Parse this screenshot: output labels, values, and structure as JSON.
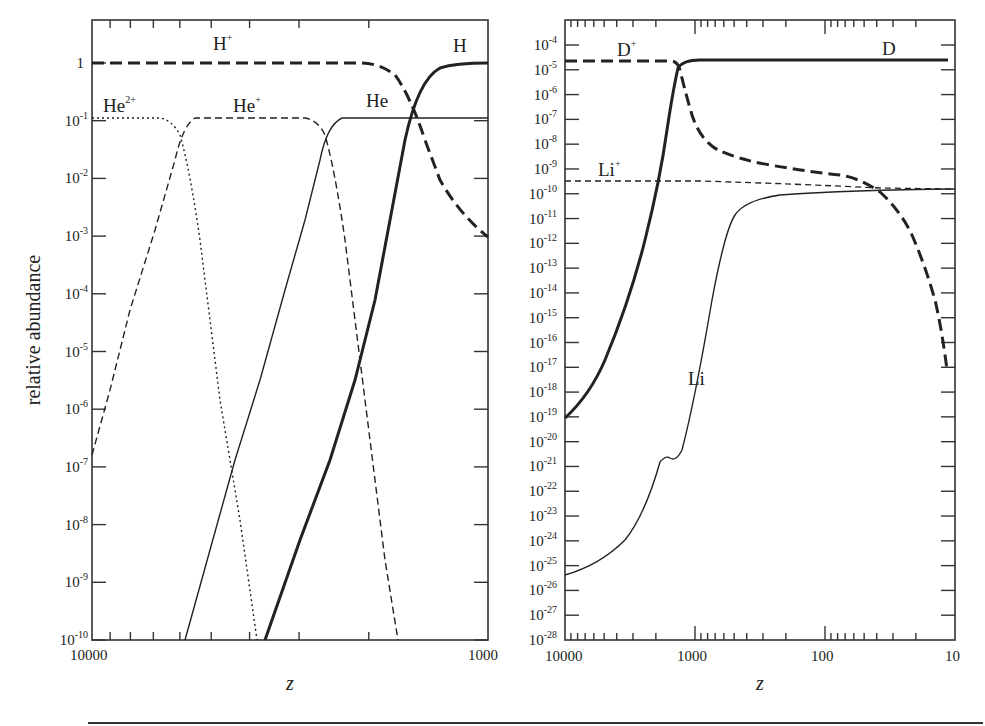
{
  "figure": {
    "ylabel": "relative abundance",
    "xlabel": "z"
  },
  "chart_data": [
    {
      "type": "line",
      "panel": "left",
      "title": "",
      "xlabel": "z",
      "ylabel": "relative abundance",
      "xscale": "log",
      "yscale": "log",
      "xlim": [
        10000,
        1000
      ],
      "ylim": [
        1e-10,
        5
      ],
      "x_tick_labels": [
        "10000",
        "1000"
      ],
      "y_tick_labels": [
        "1",
        "10^-1",
        "10^-2",
        "10^-3",
        "10^-4",
        "10^-5",
        "10^-6",
        "10^-7",
        "10^-8",
        "10^-9",
        "10^-10"
      ],
      "grid": false,
      "legend": "inline labels",
      "series": [
        {
          "name": "H+",
          "style": "thick dashed",
          "x": [
            10000,
            3000,
            1900,
            1700,
            1500,
            1300,
            1150,
            1000
          ],
          "y": [
            0.92,
            0.92,
            0.88,
            0.6,
            0.12,
            0.01,
            0.002,
            0.0009
          ]
        },
        {
          "name": "H",
          "style": "thick solid",
          "x": [
            4400,
            3500,
            2800,
            2300,
            2000,
            1800,
            1650,
            1400,
            1000
          ],
          "y": [
            1e-10,
            1e-08,
            1e-06,
            3e-05,
            0.003,
            0.1,
            0.6,
            0.9,
            0.92
          ]
        },
        {
          "name": "He2+",
          "style": "dotted",
          "x": [
            10000,
            7500,
            7000,
            6600,
            6000,
            5500,
            5000,
            4600
          ],
          "y": [
            0.11,
            0.1,
            0.06,
            0.01,
            0.0001,
            1e-06,
            1e-08,
            1e-10
          ]
        },
        {
          "name": "He+",
          "style": "thin dashed",
          "x": [
            10000,
            9000,
            8000,
            7200,
            6700,
            6000,
            3500,
            3100,
            2900,
            2700,
            2600,
            2400
          ],
          "y": [
            1.6e-07,
            1e-05,
            0.001,
            0.03,
            0.1,
            0.11,
            0.11,
            0.06,
            0.01,
            0.0001,
            1e-06,
            1e-10
          ]
        },
        {
          "name": "He",
          "style": "thin solid",
          "x": [
            5900,
            5000,
            4400,
            3900,
            3500,
            3200,
            3000,
            2700,
            1000
          ],
          "y": [
            1e-10,
            1e-08,
            1e-06,
            0.0001,
            0.005,
            0.06,
            0.1,
            0.11,
            0.11
          ]
        }
      ],
      "annotations": [
        "H+",
        "H",
        "He2+",
        "He+",
        "He"
      ]
    },
    {
      "type": "line",
      "panel": "right",
      "title": "",
      "xlabel": "z",
      "ylabel": "",
      "xscale": "log",
      "yscale": "log",
      "xlim": [
        10000,
        10
      ],
      "ylim": [
        1e-28,
        0.001
      ],
      "x_tick_labels": [
        "10000",
        "1000",
        "100",
        "10"
      ],
      "y_tick_labels": [
        "10^-4",
        "10^-5",
        "10^-6",
        "10^-7",
        "10^-8",
        "10^-9",
        "10^-10",
        "10^-11",
        "10^-12",
        "10^-13",
        "10^-14",
        "10^-15",
        "10^-16",
        "10^-17",
        "10^-18",
        "10^-19",
        "10^-20",
        "10^-21",
        "10^-22",
        "10^-23",
        "10^-24",
        "10^-25",
        "10^-26",
        "10^-27",
        "10^-28"
      ],
      "grid": false,
      "legend": "inline labels",
      "series": [
        {
          "name": "D+",
          "style": "thick dashed",
          "x": [
            10000,
            1200,
            1100,
            1000,
            850,
            700,
            500,
            200,
            80,
            40,
            30,
            20,
            15,
            12
          ],
          "y": [
            2.5e-05,
            2.5e-05,
            1e-05,
            1e-06,
            1e-07,
            2e-08,
            5e-09,
            2e-09,
            1e-09,
            3e-10,
            1.5e-10,
            1e-12,
            1e-14,
            5e-17
          ]
        },
        {
          "name": "D",
          "style": "thick solid",
          "x": [
            10000,
            7000,
            5000,
            3500,
            2500,
            1800,
            1400,
            1200,
            1100,
            1000,
            12
          ],
          "y": [
            1e-19,
            1e-17,
            1e-15,
            1e-13,
            1e-11,
            3e-10,
            1e-07,
            3e-06,
            1.5e-05,
            2.5e-05,
            2.5e-05
          ]
        },
        {
          "name": "Li+",
          "style": "thin dashed",
          "x": [
            10000,
            1000,
            100,
            30,
            10
          ],
          "y": [
            3e-10,
            3e-10,
            2.5e-10,
            1.8e-10,
            1.6e-10
          ]
        },
        {
          "name": "Li",
          "style": "thin solid",
          "x": [
            10000,
            6000,
            3500,
            2200,
            1500,
            1300,
            1100,
            1000,
            900,
            800,
            700,
            600,
            520,
            450,
            400,
            300,
            100,
            30,
            10
          ],
          "y": [
            3e-26,
            1e-25,
            1e-24,
            3e-23,
            1e-21,
            4e-21,
            5e-21,
            2e-21,
            5e-21,
            1e-18,
            1e-16,
            1e-14,
            1e-12,
            2e-11,
            5e-11,
            8e-11,
            1.3e-10,
            1.5e-10,
            1.6e-10
          ]
        }
      ],
      "annotations": [
        "D+",
        "D",
        "Li+",
        "Li"
      ]
    }
  ],
  "left_panel": {
    "x_labels": [
      "10000",
      "1000"
    ],
    "y_labels": [
      {
        "base": "1",
        "exp": ""
      },
      {
        "base": "10",
        "exp": "-1"
      },
      {
        "base": "10",
        "exp": "-2"
      },
      {
        "base": "10",
        "exp": "-3"
      },
      {
        "base": "10",
        "exp": "-4"
      },
      {
        "base": "10",
        "exp": "-5"
      },
      {
        "base": "10",
        "exp": "-6"
      },
      {
        "base": "10",
        "exp": "-7"
      },
      {
        "base": "10",
        "exp": "-8"
      },
      {
        "base": "10",
        "exp": "-9"
      },
      {
        "base": "10",
        "exp": "-10"
      }
    ],
    "labels": {
      "hplus": {
        "base": "H",
        "sup": "+"
      },
      "h": {
        "base": "H",
        "sup": ""
      },
      "he2plus": {
        "base": "He",
        "sup": "2+"
      },
      "heplus": {
        "base": "He",
        "sup": "+"
      },
      "he": {
        "base": "He",
        "sup": ""
      }
    }
  },
  "right_panel": {
    "x_labels": [
      "10000",
      "1000",
      "100",
      "10"
    ],
    "labels": {
      "dplus": {
        "base": "D",
        "sup": "+"
      },
      "d": {
        "base": "D",
        "sup": ""
      },
      "liplus": {
        "base": "Li",
        "sup": "+"
      },
      "li": {
        "base": "Li",
        "sup": ""
      }
    }
  },
  "colors": {
    "ink": "#222222",
    "background": "#ffffff"
  }
}
